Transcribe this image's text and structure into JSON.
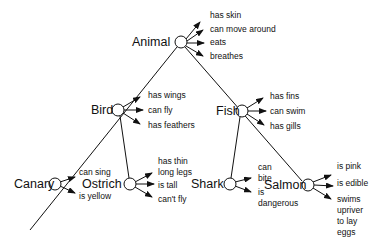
{
  "diagram": {
    "type": "semantic-network",
    "nodes": {
      "animal": {
        "label": "Animal",
        "properties": [
          "has skin",
          "can move around",
          "eats",
          "breathes"
        ]
      },
      "bird": {
        "label": "Bird",
        "properties": [
          "has wings",
          "can fly",
          "has feathers"
        ]
      },
      "fish": {
        "label": "Fish",
        "properties": [
          "has fins",
          "can swim",
          "has gills"
        ]
      },
      "canary": {
        "label": "Canary",
        "properties": [
          "can sing",
          "is yellow"
        ]
      },
      "ostrich": {
        "label": "Ostrich",
        "properties": [
          "has thin long legs",
          "is tall",
          "can't fly"
        ]
      },
      "shark": {
        "label": "Shark",
        "properties": [
          "can bite",
          "is dangerous"
        ]
      },
      "salmon": {
        "label": "Salmon",
        "properties": [
          "is pink",
          "is edible",
          "swims upriver to lay eggs"
        ]
      }
    },
    "edges": [
      {
        "from": "Animal",
        "to": "Bird"
      },
      {
        "from": "Animal",
        "to": "Fish"
      },
      {
        "from": "Bird",
        "to": "Canary"
      },
      {
        "from": "Bird",
        "to": "Ostrich"
      },
      {
        "from": "Fish",
        "to": "Shark"
      },
      {
        "from": "Fish",
        "to": "Salmon"
      }
    ]
  }
}
